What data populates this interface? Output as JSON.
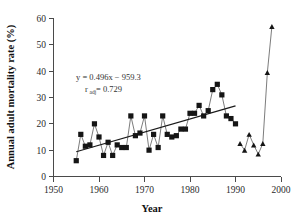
{
  "chart_data": {
    "type": "scatter",
    "title": "",
    "xlabel": "Year",
    "ylabel": "Annual adult mortality rate (%)",
    "xlim": [
      1950,
      2000
    ],
    "ylim": [
      0,
      60
    ],
    "xticks": [
      1950,
      1960,
      1970,
      1980,
      1990,
      2000
    ],
    "yticks": [
      0,
      10,
      20,
      30,
      40,
      50,
      60
    ],
    "grid": false,
    "legend": "none",
    "annotations": [
      "y = 0.496x − 959.3",
      "r",
      "adj",
      " = 0.729"
    ],
    "equation_line1": "y = 0.496x − 959.3",
    "equation_r_symbol": "r",
    "equation_r_subscript": "adj",
    "equation_line2_value": " = 0.729",
    "series": [
      {
        "name": "Annual adult mortality rate (squares)",
        "marker": "square",
        "connected": true,
        "x": [
          1955,
          1956,
          1957,
          1958,
          1959,
          1960,
          1961,
          1962,
          1963,
          1964,
          1965,
          1966,
          1967,
          1968,
          1969,
          1970,
          1971,
          1972,
          1973,
          1974,
          1975,
          1976,
          1977,
          1978,
          1979,
          1980,
          1981,
          1982,
          1983,
          1984,
          1985,
          1986,
          1987,
          1988,
          1989,
          1990
        ],
        "values": [
          6,
          16,
          11.5,
          12,
          20,
          15,
          8,
          13,
          8,
          12,
          11,
          11,
          23,
          15.5,
          16.5,
          23,
          10,
          16,
          11,
          23,
          16,
          15,
          15.5,
          18,
          18,
          24,
          24,
          27,
          23,
          25,
          33,
          35,
          31,
          23,
          22,
          20
        ]
      },
      {
        "name": "Annual adult mortality rate (triangles)",
        "marker": "triangle",
        "connected": true,
        "x": [
          1991,
          1992,
          1993,
          1994,
          1995,
          1996,
          1997,
          1998
        ],
        "values": [
          12.5,
          10,
          16,
          12,
          8.5,
          12.5,
          39.5,
          57
        ]
      },
      {
        "name": "Linear trend",
        "marker": "none",
        "type": "line",
        "x": [
          1955,
          1990
        ],
        "values": [
          9.4,
          26.8
        ]
      }
    ]
  },
  "figure": {
    "tick_labels_x": [
      "1950",
      "1960",
      "1970",
      "1980",
      "1990",
      "2000"
    ],
    "tick_labels_y": [
      "0",
      "10",
      "20",
      "30",
      "40",
      "50",
      "60"
    ],
    "x_axis_title": "Year",
    "y_axis_title": "Annual adult mortality rate (%)"
  },
  "colors": {
    "marker": "#151515",
    "series_line": "#5a5a5a",
    "trend_line": "#1a1a1a",
    "axis": "#4a4a4a",
    "text": "#2b2b2b",
    "background": "#ffffff"
  }
}
